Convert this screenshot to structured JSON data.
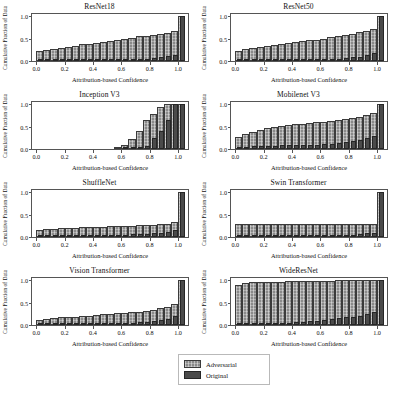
{
  "figure": {
    "rows": 4,
    "cols": 2,
    "shared_xlabel": "Attribution-based Confidence",
    "shared_ylabel": "Cumulative Fraction of Data"
  },
  "legend": {
    "position": "bottom-center",
    "entries": [
      {
        "label": "Adversarial",
        "color": "#8a8a8a",
        "style": "hatched"
      },
      {
        "label": "Original",
        "color": "#4a4a4a",
        "style": "solid"
      }
    ]
  },
  "chart_data": [
    {
      "type": "bar",
      "title": "ResNet18",
      "xlabel": "Attribution-based Confidence",
      "ylabel": "Cumulative Fraction of Data",
      "xlim": [
        -0.03,
        1.07
      ],
      "ylim": [
        0.0,
        1.05
      ],
      "xticks": [
        "0.0",
        "0.2",
        "0.4",
        "0.6",
        "0.8",
        "1.0"
      ],
      "yticks": [
        "0.0",
        "0.5",
        "1.0"
      ],
      "grid": false,
      "x": [
        0.025,
        0.075,
        0.125,
        0.175,
        0.225,
        0.275,
        0.325,
        0.375,
        0.425,
        0.475,
        0.525,
        0.575,
        0.625,
        0.675,
        0.725,
        0.775,
        0.825,
        0.875,
        0.925,
        0.975,
        1.025
      ],
      "series": [
        {
          "name": "Adversarial",
          "values": [
            0.22,
            0.25,
            0.27,
            0.3,
            0.32,
            0.34,
            0.37,
            0.39,
            0.41,
            0.43,
            0.45,
            0.47,
            0.5,
            0.52,
            0.55,
            0.57,
            0.59,
            0.6,
            0.63,
            0.66,
            1.0
          ]
        },
        {
          "name": "Original",
          "values": [
            0.01,
            0.01,
            0.01,
            0.01,
            0.01,
            0.01,
            0.02,
            0.02,
            0.02,
            0.02,
            0.02,
            0.03,
            0.03,
            0.03,
            0.04,
            0.05,
            0.06,
            0.08,
            0.11,
            0.14,
            1.0
          ]
        }
      ]
    },
    {
      "type": "bar",
      "title": "ResNet50",
      "xlabel": "Attribution-based Confidence",
      "ylabel": "Cumulative Fraction of Data",
      "xlim": [
        -0.03,
        1.07
      ],
      "ylim": [
        0.0,
        1.05
      ],
      "xticks": [
        "0.0",
        "0.2",
        "0.4",
        "0.6",
        "0.8",
        "1.0"
      ],
      "yticks": [
        "0.0",
        "0.5",
        "1.0"
      ],
      "grid": false,
      "x": [
        0.025,
        0.075,
        0.125,
        0.175,
        0.225,
        0.275,
        0.325,
        0.375,
        0.425,
        0.475,
        0.525,
        0.575,
        0.625,
        0.675,
        0.725,
        0.775,
        0.825,
        0.875,
        0.925,
        0.975,
        1.025
      ],
      "series": [
        {
          "name": "Adversarial",
          "values": [
            0.23,
            0.27,
            0.29,
            0.31,
            0.33,
            0.35,
            0.37,
            0.4,
            0.42,
            0.44,
            0.46,
            0.48,
            0.5,
            0.53,
            0.56,
            0.58,
            0.61,
            0.64,
            0.68,
            0.72,
            1.0
          ]
        },
        {
          "name": "Original",
          "values": [
            0.01,
            0.01,
            0.01,
            0.01,
            0.01,
            0.02,
            0.02,
            0.02,
            0.02,
            0.03,
            0.03,
            0.03,
            0.04,
            0.04,
            0.05,
            0.06,
            0.08,
            0.1,
            0.13,
            0.17,
            1.0
          ]
        }
      ]
    },
    {
      "type": "bar",
      "title": "Inception V3",
      "xlabel": "Attribution-based Confidence",
      "ylabel": "Cumulative Fraction of Data",
      "xlim": [
        -0.03,
        1.07
      ],
      "ylim": [
        0.0,
        1.05
      ],
      "xticks": [
        "0.0",
        "0.2",
        "0.4",
        "0.6",
        "0.8",
        "1.0"
      ],
      "yticks": [
        "0.0",
        "0.5",
        "1.0"
      ],
      "grid": false,
      "x": [
        0.025,
        0.075,
        0.125,
        0.175,
        0.225,
        0.275,
        0.325,
        0.375,
        0.425,
        0.475,
        0.525,
        0.575,
        0.625,
        0.675,
        0.725,
        0.775,
        0.825,
        0.875,
        0.925,
        0.975,
        1.025
      ],
      "series": [
        {
          "name": "Adversarial",
          "values": [
            0.0,
            0.0,
            0.0,
            0.0,
            0.0,
            0.0,
            0.0,
            0.0,
            0.0,
            0.0,
            0.0,
            0.04,
            0.1,
            0.22,
            0.4,
            0.65,
            0.78,
            0.93,
            1.0,
            1.0,
            1.0
          ]
        },
        {
          "name": "Original",
          "values": [
            0.0,
            0.0,
            0.0,
            0.0,
            0.0,
            0.0,
            0.0,
            0.0,
            0.0,
            0.0,
            0.0,
            0.0,
            0.01,
            0.02,
            0.03,
            0.06,
            0.25,
            0.4,
            0.65,
            1.0,
            1.0
          ]
        }
      ]
    },
    {
      "type": "bar",
      "title": "Mobilenet V3",
      "xlabel": "Attribution-based Confidence",
      "ylabel": "Cumulative Fraction of Data",
      "xlim": [
        -0.03,
        1.07
      ],
      "ylim": [
        0.0,
        1.05
      ],
      "xticks": [
        "0.0",
        "0.2",
        "0.4",
        "0.6",
        "0.8",
        "1.0"
      ],
      "yticks": [
        "0.0",
        "0.5",
        "1.0"
      ],
      "grid": false,
      "x": [
        0.025,
        0.075,
        0.125,
        0.175,
        0.225,
        0.275,
        0.325,
        0.375,
        0.425,
        0.475,
        0.525,
        0.575,
        0.625,
        0.675,
        0.725,
        0.775,
        0.825,
        0.875,
        0.925,
        0.975,
        1.025
      ],
      "series": [
        {
          "name": "Adversarial",
          "values": [
            0.27,
            0.33,
            0.39,
            0.43,
            0.46,
            0.49,
            0.51,
            0.53,
            0.55,
            0.56,
            0.58,
            0.6,
            0.61,
            0.63,
            0.65,
            0.67,
            0.69,
            0.72,
            0.76,
            0.8,
            1.0
          ]
        },
        {
          "name": "Original",
          "values": [
            0.04,
            0.05,
            0.06,
            0.06,
            0.07,
            0.07,
            0.08,
            0.08,
            0.09,
            0.09,
            0.1,
            0.1,
            0.11,
            0.12,
            0.13,
            0.15,
            0.17,
            0.2,
            0.24,
            0.3,
            1.0
          ]
        }
      ]
    },
    {
      "type": "bar",
      "title": "ShuffleNet",
      "xlabel": "Attribution-based Confidence",
      "ylabel": "Cumulative Fraction of Data",
      "xlim": [
        -0.03,
        1.07
      ],
      "ylim": [
        0.0,
        1.05
      ],
      "xticks": [
        "0.0",
        "0.2",
        "0.4",
        "0.6",
        "0.8",
        "1.0"
      ],
      "yticks": [
        "0.0",
        "0.5",
        "1.0"
      ],
      "grid": false,
      "x": [
        0.025,
        0.075,
        0.125,
        0.175,
        0.225,
        0.275,
        0.325,
        0.375,
        0.425,
        0.475,
        0.525,
        0.575,
        0.625,
        0.675,
        0.725,
        0.775,
        0.825,
        0.875,
        0.925,
        0.975,
        1.025
      ],
      "series": [
        {
          "name": "Adversarial",
          "values": [
            0.16,
            0.18,
            0.19,
            0.2,
            0.21,
            0.21,
            0.22,
            0.22,
            0.23,
            0.23,
            0.24,
            0.24,
            0.25,
            0.25,
            0.26,
            0.27,
            0.27,
            0.28,
            0.3,
            0.33,
            1.0
          ]
        },
        {
          "name": "Original",
          "values": [
            0.02,
            0.02,
            0.03,
            0.03,
            0.03,
            0.03,
            0.04,
            0.04,
            0.04,
            0.04,
            0.05,
            0.05,
            0.05,
            0.06,
            0.06,
            0.07,
            0.08,
            0.09,
            0.11,
            0.15,
            1.0
          ]
        }
      ]
    },
    {
      "type": "bar",
      "title": "Swin Transformer",
      "xlabel": "Attribution-based Confidence",
      "ylabel": "Cumulative Fraction of Data",
      "xlim": [
        -0.03,
        1.07
      ],
      "ylim": [
        0.0,
        1.05
      ],
      "xticks": [
        "0.0",
        "0.2",
        "0.4",
        "0.6",
        "0.8",
        "1.0"
      ],
      "yticks": [
        "0.0",
        "0.5",
        "1.0"
      ],
      "grid": false,
      "x": [
        0.025,
        0.075,
        0.125,
        0.175,
        0.225,
        0.275,
        0.325,
        0.375,
        0.425,
        0.475,
        0.525,
        0.575,
        0.625,
        0.675,
        0.725,
        0.775,
        0.825,
        0.875,
        0.925,
        0.975,
        1.025
      ],
      "series": [
        {
          "name": "Adversarial",
          "values": [
            0.28,
            0.28,
            0.28,
            0.28,
            0.28,
            0.28,
            0.28,
            0.28,
            0.28,
            0.28,
            0.28,
            0.28,
            0.28,
            0.28,
            0.28,
            0.28,
            0.28,
            0.28,
            0.28,
            0.28,
            1.0
          ]
        },
        {
          "name": "Original",
          "values": [
            0.01,
            0.01,
            0.01,
            0.01,
            0.01,
            0.01,
            0.01,
            0.01,
            0.02,
            0.02,
            0.02,
            0.02,
            0.02,
            0.03,
            0.03,
            0.04,
            0.05,
            0.06,
            0.08,
            0.1,
            1.0
          ]
        }
      ]
    },
    {
      "type": "bar",
      "title": "Vision Transformer",
      "xlabel": "Attribution-based Confidence",
      "ylabel": "Cumulative Fraction of Data",
      "xlim": [
        -0.03,
        1.07
      ],
      "ylim": [
        0.0,
        1.05
      ],
      "xticks": [
        "0.0",
        "0.2",
        "0.4",
        "0.6",
        "0.8",
        "1.0"
      ],
      "yticks": [
        "0.0",
        "0.5",
        "1.0"
      ],
      "grid": false,
      "x": [
        0.025,
        0.075,
        0.125,
        0.175,
        0.225,
        0.275,
        0.325,
        0.375,
        0.425,
        0.475,
        0.525,
        0.575,
        0.625,
        0.675,
        0.725,
        0.775,
        0.825,
        0.875,
        0.925,
        0.975,
        1.025
      ],
      "series": [
        {
          "name": "Adversarial",
          "values": [
            0.11,
            0.14,
            0.16,
            0.17,
            0.18,
            0.19,
            0.2,
            0.21,
            0.23,
            0.24,
            0.25,
            0.26,
            0.27,
            0.28,
            0.3,
            0.32,
            0.34,
            0.37,
            0.41,
            0.46,
            1.0
          ]
        },
        {
          "name": "Original",
          "values": [
            0.01,
            0.01,
            0.02,
            0.02,
            0.02,
            0.02,
            0.03,
            0.03,
            0.03,
            0.04,
            0.04,
            0.04,
            0.05,
            0.05,
            0.06,
            0.07,
            0.09,
            0.11,
            0.14,
            0.2,
            1.0
          ]
        }
      ]
    },
    {
      "type": "bar",
      "title": "WideResNet",
      "xlabel": "Attribution-based Confidence",
      "ylabel": "Cumulative Fraction of Data",
      "xlim": [
        -0.03,
        1.07
      ],
      "ylim": [
        0.0,
        1.05
      ],
      "xticks": [
        "0.0",
        "0.2",
        "0.4",
        "0.6",
        "0.8",
        "1.0"
      ],
      "yticks": [
        "0.0",
        "0.5",
        "1.0"
      ],
      "grid": false,
      "x": [
        0.025,
        0.075,
        0.125,
        0.175,
        0.225,
        0.275,
        0.325,
        0.375,
        0.425,
        0.475,
        0.525,
        0.575,
        0.625,
        0.675,
        0.725,
        0.775,
        0.825,
        0.875,
        0.925,
        0.975,
        1.025
      ],
      "series": [
        {
          "name": "Adversarial",
          "values": [
            0.89,
            0.93,
            0.95,
            0.96,
            0.96,
            0.97,
            0.97,
            0.98,
            0.98,
            0.98,
            0.99,
            0.99,
            0.99,
            0.99,
            1.0,
            1.0,
            1.0,
            1.0,
            1.0,
            1.0,
            1.0
          ]
        },
        {
          "name": "Original",
          "values": [
            0.02,
            0.02,
            0.03,
            0.03,
            0.04,
            0.04,
            0.05,
            0.05,
            0.06,
            0.07,
            0.08,
            0.09,
            0.11,
            0.13,
            0.15,
            0.17,
            0.19,
            0.21,
            0.24,
            0.3,
            1.0
          ]
        }
      ]
    }
  ]
}
